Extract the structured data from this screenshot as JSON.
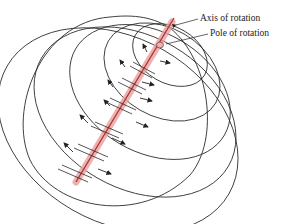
{
  "diagram": {
    "type": "sphere-rotation-pole",
    "labels": {
      "axis": "Axis of rotation",
      "pole": "Pole of rotation"
    },
    "colors": {
      "outline": "#2a2a2a",
      "axis_line": "#b03030",
      "axis_band": "#e8a0a0",
      "pole_fill": "#e9b3b3",
      "arrow": "#222222"
    }
  }
}
